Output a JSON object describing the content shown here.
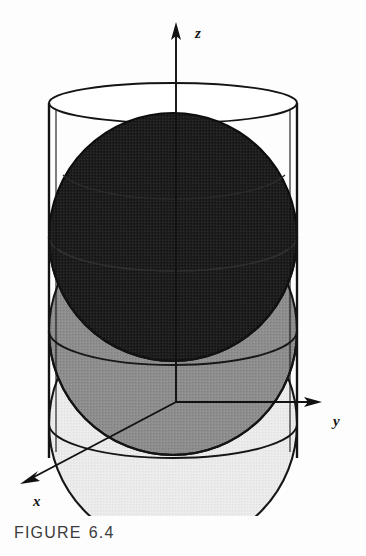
{
  "figure": {
    "caption_prefix": "FIGURE",
    "caption_number": "6.4"
  },
  "axes": {
    "z_label": "z",
    "y_label": "y",
    "x_label": "x",
    "origin": {
      "x": 176,
      "y": 402
    },
    "z_tip": {
      "x": 176,
      "y": 26
    },
    "y_tip": {
      "x": 318,
      "y": 402
    },
    "x_tip": {
      "x": 22,
      "y": 483
    }
  },
  "cylinder": {
    "center_x": 173,
    "radius_x": 124,
    "top_center_y": 103,
    "bottom_center_y": 455,
    "ellipse_ry": 20,
    "stroke": "#141414",
    "stroke_width": 2.0,
    "fill": "none",
    "left_wall_x": 49,
    "right_wall_x": 297
  },
  "spheres": [
    {
      "name": "top-sphere",
      "shade": "dark",
      "fill": "#1d1d1d",
      "cx": 173,
      "cy": 237,
      "r": 124,
      "stroke": "#0d0d0d"
    },
    {
      "name": "middle-sphere",
      "shade": "medium",
      "fill": "#8d8d8d",
      "cx": 173,
      "cy": 331,
      "r": 124,
      "stroke": "#161616"
    },
    {
      "name": "bottom-sphere",
      "shade": "light",
      "fill": "#e9e9e9",
      "cx": 173,
      "cy": 424,
      "r": 124,
      "stroke": "#161616"
    }
  ],
  "colors": {
    "background": "#fdfdfd",
    "line": "#141414",
    "dark_fill": "#1d1d1d",
    "medium_fill": "#8d8d8d",
    "light_fill": "#e9e9e9",
    "caption_text": "#3b3b3b"
  },
  "equator_arcs": [
    {
      "name": "top-sphere-equator",
      "cy": 237,
      "ry": 34
    },
    {
      "name": "middle-sphere-equator",
      "cy": 331,
      "ry": 34
    },
    {
      "name": "bottom-sphere-equator",
      "cy": 424,
      "ry": 34
    }
  ]
}
